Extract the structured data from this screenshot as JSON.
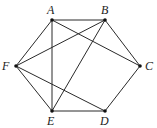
{
  "diagram": {
    "type": "graph",
    "vertices": [
      {
        "id": "A",
        "label": "A",
        "x": 52,
        "y": 20,
        "lx": 47,
        "ly": 14
      },
      {
        "id": "B",
        "label": "B",
        "x": 105,
        "y": 20,
        "lx": 101,
        "ly": 14
      },
      {
        "id": "C",
        "label": "C",
        "x": 140,
        "y": 66,
        "lx": 145,
        "ly": 70
      },
      {
        "id": "D",
        "label": "D",
        "x": 105,
        "y": 111,
        "lx": 100,
        "ly": 125
      },
      {
        "id": "E",
        "label": "E",
        "x": 52,
        "y": 111,
        "lx": 47,
        "ly": 125
      },
      {
        "id": "F",
        "label": "F",
        "x": 16,
        "y": 66,
        "lx": 2,
        "ly": 70
      }
    ],
    "edges": [
      [
        "A",
        "B"
      ],
      [
        "B",
        "C"
      ],
      [
        "C",
        "D"
      ],
      [
        "D",
        "E"
      ],
      [
        "E",
        "F"
      ],
      [
        "F",
        "A"
      ],
      [
        "A",
        "E"
      ],
      [
        "A",
        "C"
      ],
      [
        "B",
        "F"
      ],
      [
        "B",
        "E"
      ],
      [
        "F",
        "D"
      ]
    ]
  }
}
